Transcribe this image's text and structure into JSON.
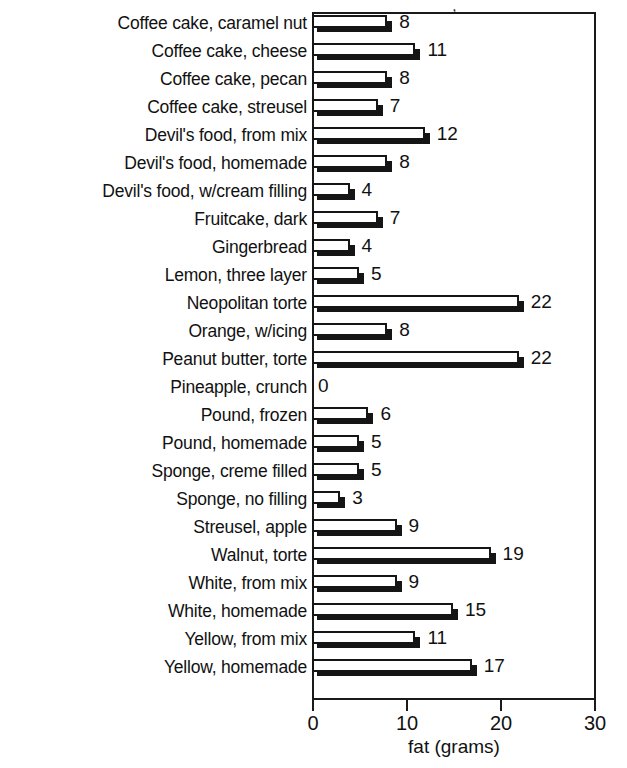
{
  "chart_data": {
    "type": "bar",
    "orientation": "horizontal",
    "title": "",
    "xlabel": "fat (grams)",
    "ylabel": "",
    "xlim": [
      0,
      30
    ],
    "xticks": [
      0,
      10,
      20,
      30
    ],
    "xtick_labels": [
      "0",
      "10",
      "20",
      "30"
    ],
    "grid": false,
    "legend": null,
    "value_labels_shown": true,
    "categories": [
      "Coffee cake, caramel nut",
      "Coffee cake, cheese",
      "Coffee cake, pecan",
      "Coffee cake, streusel",
      "Devil's food, from mix",
      "Devil's food, homemade",
      "Devil's food, w/cream filling",
      "Fruitcake, dark",
      "Gingerbread",
      "Lemon, three layer",
      "Neopolitan torte",
      "Orange, w/icing",
      "Peanut butter, torte",
      "Pineapple, crunch",
      "Pound, frozen",
      "Pound, homemade",
      "Sponge, creme filled",
      "Sponge, no filling",
      "Streusel, apple",
      "Walnut, torte",
      "White, from mix",
      "White, homemade",
      "Yellow, from mix",
      "Yellow, homemade"
    ],
    "values": [
      8,
      11,
      8,
      7,
      12,
      8,
      4,
      7,
      4,
      5,
      22,
      8,
      22,
      0,
      6,
      5,
      5,
      3,
      9,
      19,
      9,
      15,
      11,
      17
    ],
    "value_label_text": [
      "8",
      "11",
      "8",
      "7",
      "12",
      "8",
      "4",
      "7",
      "4",
      "5",
      "22",
      "8",
      "22",
      "0",
      "6",
      "5",
      "5",
      "3",
      "9",
      "19",
      "9",
      "15",
      "11",
      "17"
    ]
  },
  "style": {
    "bar_face_color": "#ffffff",
    "bar_edge_color": "#151515",
    "bar_shadow_color": "#151515",
    "frame_color": "#1a1a1a",
    "text_color": "#111111",
    "background": "#ffffff"
  },
  "artifact": {
    "top_cropped_title": ","
  }
}
